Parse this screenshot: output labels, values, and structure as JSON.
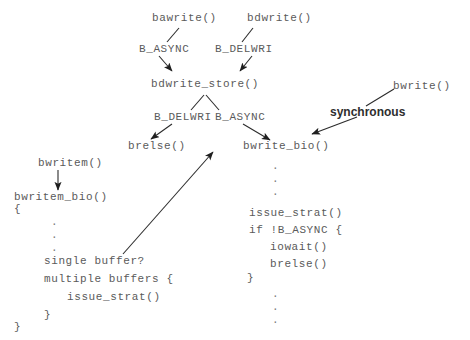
{
  "diagram": {
    "background_color": "#ffffff",
    "text_color": "#5a5a5a",
    "arrow_color": "#2b2b2b",
    "accent_text_color": "#2e2e2e"
  },
  "nodes": {
    "bawrite": "bawrite()",
    "bdwrite": "bdwrite()",
    "flag_b_async_top": "B_ASYNC",
    "flag_b_delwri_top": "B_DELWRI",
    "bdwrite_store": "bdwrite_store()",
    "flag_b_delwri_mid": "B_DELWRI",
    "flag_b_async_mid": "B_ASYNC",
    "brelse": "brelse()",
    "bwrite_bio": "bwrite_bio()",
    "bwrite": "bwrite()",
    "synchronous": "synchronous",
    "bwritem": "bwritem()",
    "bwritem_bio": "bwritem_bio()"
  },
  "bwritem_bio_block": {
    "open_brace": "{",
    "dots_1": [
      ".",
      ".",
      "."
    ],
    "line_single_buffer": "single buffer?",
    "line_multiple_buffers": "multiple buffers {",
    "line_issue_strat": "issue_strat()",
    "close_brace_inner": "}",
    "close_brace_outer": "}"
  },
  "bwrite_bio_block": {
    "dots_1": [
      ".",
      ".",
      "."
    ],
    "line_issue_strat": "issue_strat()",
    "line_if_async": "if !B_ASYNC {",
    "line_iowait": "iowait()",
    "line_brelse": "brelse()",
    "close_brace": "}",
    "dots_2": [
      ".",
      ".",
      "."
    ]
  },
  "edges": [
    {
      "name": "bawrite-to-b-async",
      "from": "bawrite()",
      "to": "B_ASYNC",
      "arrowhead": false
    },
    {
      "name": "bdwrite-to-b-delwri",
      "from": "bdwrite()",
      "to": "B_DELWRI",
      "arrowhead": false
    },
    {
      "name": "b-async-to-bdwrite-store",
      "from": "B_ASYNC",
      "to": "bdwrite_store()",
      "arrowhead": true
    },
    {
      "name": "b-delwri-to-bdwrite-store",
      "from": "B_DELWRI",
      "to": "bdwrite_store()",
      "arrowhead": true
    },
    {
      "name": "bdwrite-store-to-b-delwri",
      "from": "bdwrite_store()",
      "to": "B_DELWRI",
      "arrowhead": false
    },
    {
      "name": "bdwrite-store-to-b-async",
      "from": "bdwrite_store()",
      "to": "B_ASYNC",
      "arrowhead": false
    },
    {
      "name": "b-delwri-to-brelse",
      "from": "B_DELWRI",
      "to": "brelse()",
      "arrowhead": true
    },
    {
      "name": "b-async-to-bwrite-bio",
      "from": "B_ASYNC",
      "to": "bwrite_bio()",
      "arrowhead": true
    },
    {
      "name": "bwrite-to-synchronous",
      "from": "bwrite()",
      "to": "synchronous",
      "arrowhead": false
    },
    {
      "name": "synchronous-to-bwrite-bio",
      "from": "synchronous",
      "to": "bwrite_bio()",
      "arrowhead": true
    },
    {
      "name": "bwritem-to-bwritem-bio",
      "from": "bwritem()",
      "to": "bwritem_bio()",
      "arrowhead": true
    },
    {
      "name": "single-buffer-to-bwrite-bio",
      "from": "single buffer?",
      "to": "bwrite_bio()",
      "arrowhead": true
    }
  ]
}
